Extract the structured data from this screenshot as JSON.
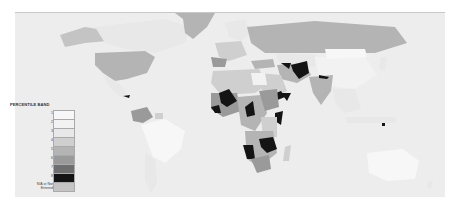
{
  "map": {
    "title": "World map shaded by percentile band",
    "background_color": "#ededed",
    "ocean_color": "#ededed"
  },
  "legend": {
    "title": "PERCENTILE BAND",
    "items": [
      {
        "label": "1",
        "color": "#f7f7f7"
      },
      {
        "label": "2",
        "color": "#f2f2f2"
      },
      {
        "label": "3",
        "color": "#e8e8e8"
      },
      {
        "label": "4",
        "color": "#cfcfcf"
      },
      {
        "label": "5",
        "color": "#b4b4b4"
      },
      {
        "label": "6",
        "color": "#9a9a9a"
      },
      {
        "label": "7",
        "color": "#6e6e6e"
      },
      {
        "label": "8",
        "color": "#141414"
      },
      {
        "label": "N/A or Not Entered",
        "color": "#c4c4c4"
      }
    ]
  },
  "colors": {
    "band1": "#f7f7f7",
    "band2": "#f2f2f2",
    "band3": "#e8e8e8",
    "band4": "#cfcfcf",
    "band5": "#b4b4b4",
    "band6": "#9a9a9a",
    "band7": "#6e6e6e",
    "band8": "#141414",
    "na": "#c4c4c4"
  }
}
